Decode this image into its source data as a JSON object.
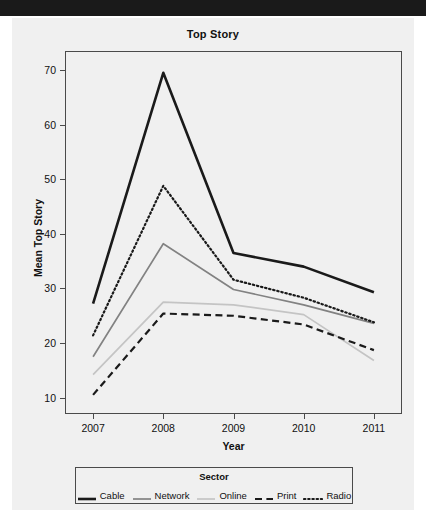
{
  "chart_data": {
    "type": "line",
    "title": "Top Story",
    "xlabel": "Year",
    "ylabel": "Mean Top Story",
    "grid": false,
    "legend_position": "bottom",
    "legend_title": "Sector",
    "categories": [
      "2007",
      "2008",
      "2009",
      "2010",
      "2011"
    ],
    "x": [
      2007,
      2008,
      2009,
      2010,
      2011
    ],
    "xlim": [
      2006.6,
      2011.4
    ],
    "ylim": [
      7.0,
      73.5
    ],
    "yticks": [
      10,
      20,
      30,
      40,
      50,
      60,
      70
    ],
    "xticks": [
      "2007",
      "2008",
      "2009",
      "2010",
      "2011"
    ],
    "series": [
      {
        "name": "Cable",
        "values": [
          27.2,
          69.5,
          36.5,
          34.0,
          29.3
        ],
        "color": "#1a1a1a",
        "style": "solid",
        "width": 2.6
      },
      {
        "name": "Network",
        "values": [
          17.5,
          38.2,
          29.8,
          27.0,
          23.6
        ],
        "color": "#828282",
        "style": "solid",
        "width": 1.7
      },
      {
        "name": "Online",
        "values": [
          14.2,
          27.5,
          27.0,
          25.2,
          16.8
        ],
        "color": "#c4c4c4",
        "style": "solid",
        "width": 1.7
      },
      {
        "name": "Print",
        "values": [
          10.5,
          25.4,
          25.0,
          23.4,
          18.7
        ],
        "color": "#1a1a1a",
        "style": "dashed",
        "width": 2.2
      },
      {
        "name": "Radio",
        "values": [
          21.4,
          48.8,
          31.6,
          28.3,
          23.8
        ],
        "color": "#1a1a1a",
        "style": "dotted",
        "width": 2.2
      }
    ]
  },
  "legend": {
    "title": "Sector",
    "entries": [
      "Cable",
      "Network",
      "Online",
      "Print",
      "Radio"
    ]
  },
  "axes": {
    "y_tick_labels": [
      "70",
      "60",
      "50",
      "40",
      "30",
      "20",
      "10"
    ],
    "x_tick_labels": [
      "2007",
      "2008",
      "2009",
      "2010",
      "2011"
    ],
    "y_axis_title": "Mean Top Story",
    "x_axis_title": "Year"
  }
}
